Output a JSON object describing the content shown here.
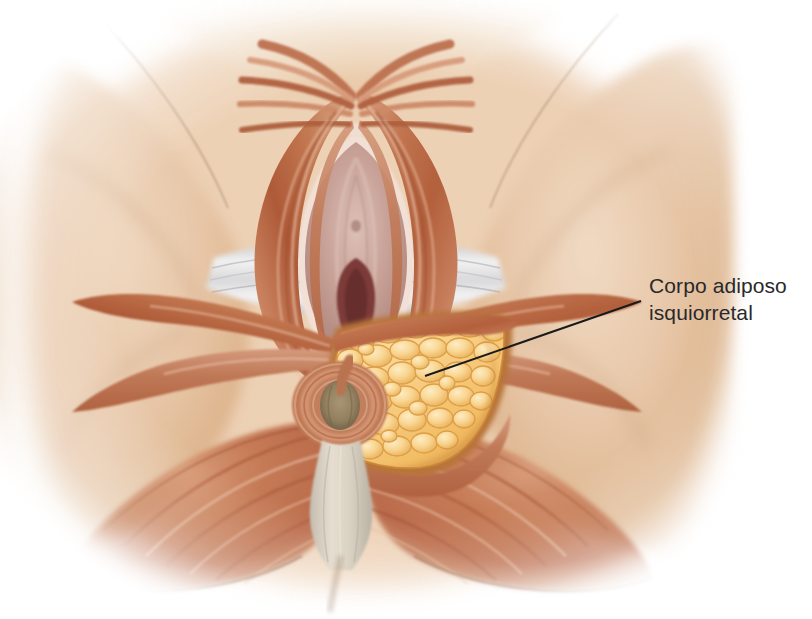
{
  "figure": {
    "title": "Corpo adiposo isquiorretal",
    "view": "vista-perineal-inferior",
    "background_color": "#ffffff"
  },
  "callouts": [
    {
      "id": "ischioanal-fat-body",
      "line_1": "Corpo adiposo",
      "line_2": "isquiorretal",
      "text_color": "#28292b",
      "leader_color": "#1a1a1a",
      "leader_start": {
        "x": 425,
        "y": 376
      },
      "leader_end": {
        "x": 641,
        "y": 301
      }
    }
  ],
  "palette": {
    "skin_light": "#f3e0cc",
    "skin_mid": "#e5c2a1",
    "skin_deep": "#d4a87f",
    "skin_shadow_line": "#8d6d53",
    "muscle_light": "#dba78c",
    "muscle_mid": "#c4795a",
    "muscle_deep": "#a85539",
    "muscle_shadow": "#8a4430",
    "fat_highlight": "#fbe3ad",
    "fat_mid": "#f6c978",
    "fat_edge": "#dd9c45",
    "fat_shadow": "#b9752f",
    "mucosa_pink": "#c9a49d",
    "mucosa_pale": "#e3cac2",
    "mucosa_deep": "#7c3a38",
    "membrane_white": "#e9e9ea",
    "membrane_gray": "#b9b9bb",
    "ligament_cream": "#ded6c8",
    "anal_mucosa": "#9a8a6e",
    "outline_dark": "#6b4a35"
  },
  "regions": [
    {
      "name": "left-thigh-medial-mass",
      "label": "Coxa esquerda"
    },
    {
      "name": "right-thigh-medial-mass",
      "label": "Coxa direita"
    },
    {
      "name": "urogenital-vestibule",
      "label": "Vestíbulo / Vulva"
    },
    {
      "name": "bulbospongiosus-muscle",
      "label": "Músculo bulboesponjoso"
    },
    {
      "name": "ischiocavernosus-muscle",
      "label": "Músculo isquiocavernoso"
    },
    {
      "name": "perineal-membrane",
      "label": "Membrana do períneo"
    },
    {
      "name": "transverse-perineal-muscle",
      "label": "Músculo transverso do períneo"
    },
    {
      "name": "external-anal-sphincter",
      "label": "Esfíncter externo do ânus"
    },
    {
      "name": "anal-canal-opening",
      "label": "Ânus"
    },
    {
      "name": "anococcygeal-body",
      "label": "Corpo anococcígeo"
    },
    {
      "name": "ischioanal-fat-body",
      "label": "Corpo adiposo isquiorretal"
    },
    {
      "name": "gluteus-maximus-left",
      "label": "Glúteo máximo esquerdo"
    },
    {
      "name": "gluteus-maximus-right",
      "label": "Glúteo máximo direito"
    }
  ]
}
